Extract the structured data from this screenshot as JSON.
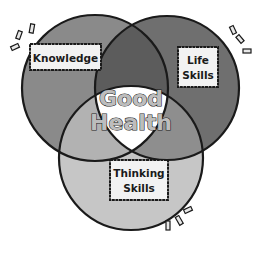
{
  "diagram": {
    "type": "venn",
    "circles": [
      {
        "id": "knowledge",
        "label": "Knowledge",
        "cx": 95,
        "cy": 88,
        "r": 73,
        "color": "#8a8a8a"
      },
      {
        "id": "life",
        "label_lines": [
          "Life",
          "Skills"
        ],
        "cx": 167,
        "cy": 88,
        "r": 72,
        "color": "#6f6f6f"
      },
      {
        "id": "thinking",
        "label_lines": [
          "Thinking",
          "Skills"
        ],
        "cx": 131,
        "cy": 158,
        "r": 72,
        "color": "#c6c6c6"
      }
    ],
    "overlaps": {
      "knowledge_life": "#5c5c5c",
      "knowledge_thinking": "#b2b2b2",
      "life_thinking": "#8e8e8e",
      "center": "#ffffff"
    },
    "center_label": {
      "line1": "Good",
      "line2": "Health"
    },
    "labels": {
      "knowledge": "Knowledge",
      "life_line1": "Life",
      "life_line2": "Skills",
      "thinking_line1": "Thinking",
      "thinking_line2": "Skills"
    },
    "outline_color": "#1a1a1a",
    "label_box_fill": "#f2f2f2"
  }
}
